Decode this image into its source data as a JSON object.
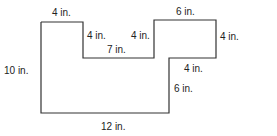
{
  "diagram": {
    "type": "composite-shape-dimensions",
    "stroke_color": "#333333",
    "labels": {
      "top_left_width": "4 in.",
      "left_notch_depth": "4 in.",
      "notch_width": "7 in.",
      "right_notch_depth": "4 in.",
      "top_right_width": "6 in.",
      "right_height": "4 in.",
      "step_width": "4 in.",
      "lower_right_height": "6 in.",
      "left_height": "10 in.",
      "bottom_width": "12 in."
    }
  }
}
